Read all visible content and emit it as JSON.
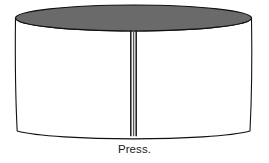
{
  "figure": {
    "caption": "Press.",
    "title": "Press",
    "colors": {
      "top_fill": "#6a6a6a",
      "body_fill": "#ffffff",
      "outline": "#111111",
      "seam": "#1a1a1a",
      "background": "#ffffff",
      "caption_text": "#1a1a1a"
    },
    "parts": {
      "top_ellipse_label": "press-top-disc",
      "body_label": "press-cylindrical-body",
      "seam_label": "press-vertical-seam",
      "bottom_arc_label": "press-bottom-edge"
    },
    "geometry": {
      "ellipse_center_x": 133.5,
      "ellipse_center_y": 18,
      "ellipse_rx": 118,
      "ellipse_ry": 13,
      "body_top_y": 18,
      "body_bottom_y": 131,
      "bottom_sag": 7,
      "seam_x": 133.5,
      "seam_top_y": 31,
      "seam_bottom_y": 136
    }
  }
}
